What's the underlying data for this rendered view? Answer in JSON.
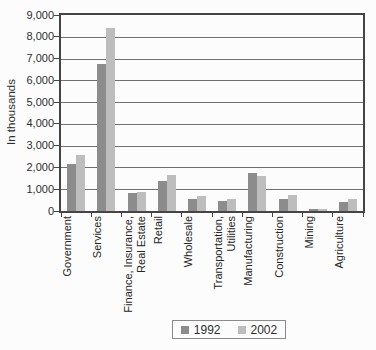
{
  "chart_data": {
    "type": "bar",
    "title": "",
    "ylabel": "In thousands",
    "ylim": [
      0,
      9000
    ],
    "ytick_interval": 1000,
    "ytick_labels": [
      "0",
      "1,000",
      "2,000",
      "3,000",
      "4,000",
      "5,000",
      "6,000",
      "7,000",
      "8,000",
      "9,000"
    ],
    "grid": true,
    "legend_position": "bottom",
    "categories": [
      "Government",
      "Services",
      "Finance, Insurance,\nReal Estate",
      "Retail",
      "Wholesale",
      "Transportation,\nUtilities",
      "Manufacturing",
      "Construction",
      "Mining",
      "Agriculture"
    ],
    "series": [
      {
        "name": "1992",
        "color": "#8c8c8c",
        "values": [
          2150,
          6750,
          820,
          1400,
          550,
          460,
          1750,
          530,
          110,
          400
        ]
      },
      {
        "name": "2002",
        "color": "#bdbdbd",
        "values": [
          2550,
          8400,
          880,
          1650,
          700,
          570,
          1600,
          750,
          100,
          550
        ]
      }
    ]
  }
}
